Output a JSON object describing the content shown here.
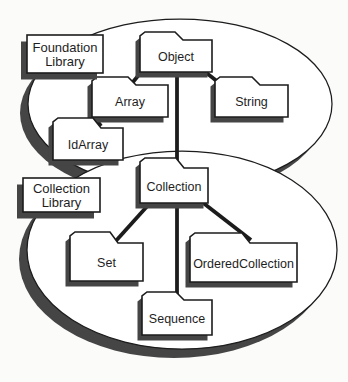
{
  "diagram": {
    "colors": {
      "background": "#fbfbfa",
      "shape_fill": "#ffffff",
      "stroke": "#1c1c1c",
      "shadow": "#454545"
    },
    "libraries": [
      {
        "id": "foundation-library",
        "label_lines": [
          "Foundation",
          "Library"
        ],
        "ellipse": {
          "cx": 180,
          "cy": 104,
          "rx": 152,
          "ry": 85
        },
        "box": {
          "x": 27,
          "y": 35,
          "w": 76,
          "h": 38
        }
      },
      {
        "id": "collection-library",
        "label_lines": [
          "Collection",
          "Library"
        ],
        "ellipse": {
          "cx": 182,
          "cy": 250,
          "rx": 155,
          "ry": 99
        },
        "box": {
          "x": 23,
          "y": 178,
          "w": 77,
          "h": 34
        }
      }
    ],
    "folders": [
      {
        "id": "object",
        "label": "Object",
        "x": 140,
        "y": 32,
        "rise": 8,
        "w": 72,
        "h": 40,
        "tabW": 43
      },
      {
        "id": "array",
        "label": "Array",
        "x": 92,
        "y": 77,
        "rise": 8,
        "w": 76,
        "h": 40,
        "tabW": 44
      },
      {
        "id": "string",
        "label": "String",
        "x": 215,
        "y": 77,
        "rise": 8,
        "w": 73,
        "h": 40,
        "tabW": 45
      },
      {
        "id": "idarray",
        "label": "IdArray",
        "x": 53,
        "y": 118,
        "rise": 10,
        "w": 70,
        "h": 42,
        "tabW": 48
      },
      {
        "id": "collection",
        "label": "Collection",
        "x": 140,
        "y": 158,
        "rise": 10,
        "w": 68,
        "h": 45,
        "tabW": 44
      },
      {
        "id": "set",
        "label": "Set",
        "x": 70,
        "y": 232,
        "rise": 11,
        "w": 73,
        "h": 49,
        "tabW": 48
      },
      {
        "id": "orderedcollection",
        "label": "OrderedCollection",
        "x": 190,
        "y": 233,
        "rise": 10,
        "w": 107,
        "h": 49,
        "tabW": 60
      },
      {
        "id": "sequence",
        "label": "Sequence",
        "x": 142,
        "y": 292,
        "rise": 8,
        "w": 70,
        "h": 43,
        "tabW": 42
      }
    ],
    "edges": [
      {
        "id": "object-array",
        "from": "object",
        "to": "array",
        "x1": 142,
        "y1": 71,
        "x2": 133,
        "y2": 82
      },
      {
        "id": "object-string",
        "from": "object",
        "to": "string",
        "x1": 204,
        "y1": 71,
        "x2": 218,
        "y2": 82
      },
      {
        "id": "object-collection",
        "from": "object",
        "to": "collection",
        "x1": 177,
        "y1": 71,
        "x2": 177,
        "y2": 162
      },
      {
        "id": "array-idarray",
        "from": "array",
        "to": "idarray",
        "x1": 94,
        "y1": 116,
        "x2": 101,
        "y2": 126
      },
      {
        "id": "collection-set",
        "from": "collection",
        "to": "set",
        "x1": 151,
        "y1": 202,
        "x2": 114,
        "y2": 243
      },
      {
        "id": "collection-orderedcollection",
        "from": "collection",
        "to": "orderedcollection",
        "x1": 202,
        "y1": 202,
        "x2": 251,
        "y2": 240
      },
      {
        "id": "collection-sequence",
        "from": "collection",
        "to": "sequence",
        "x1": 177,
        "y1": 202,
        "x2": 177,
        "y2": 298
      }
    ],
    "style": {
      "ellipse_shadow_dx": -8,
      "ellipse_shadow_dy": 9,
      "folder_shadow_dx": -4.5,
      "folder_shadow_dy": 5.5,
      "box_shadow_dx": -6,
      "box_shadow_dy": 6.5,
      "edge_width": 3.8,
      "ellipse_stroke_width": 1.25,
      "shape_stroke_width": 1.6
    }
  }
}
